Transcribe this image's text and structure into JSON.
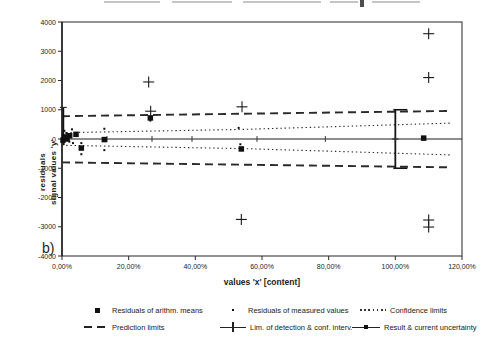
{
  "panel_label": "b)",
  "chart_data": {
    "type": "scatter",
    "title": "",
    "xlabel": "values 'x' [content]",
    "ylabel_line1": "residuals",
    "ylabel_line2": "signal values 'y'",
    "xlim": [
      0,
      120
    ],
    "ylim": [
      -4000,
      4000
    ],
    "grid": false,
    "x_tick_values": [
      0,
      20,
      40,
      60,
      80,
      100,
      120
    ],
    "x_tick_labels": [
      "0,00%",
      "20,00%",
      "40,00%",
      "60,00%",
      "80,00%",
      "100,00%",
      "120,00%"
    ],
    "y_tick_values": [
      4000,
      3000,
      2000,
      1000,
      0,
      -1000,
      -2000,
      -3000,
      -4000
    ],
    "y_tick_labels": [
      "4000",
      "3000",
      "2000",
      "1000",
      "0",
      "-1000",
      "-2000",
      "-3000",
      "-4000"
    ],
    "series": {
      "arith_means": {
        "label": "Residuals of arithm. means",
        "marker": "filled-square",
        "points": [
          [
            0.3,
            -40
          ],
          [
            0.8,
            70
          ],
          [
            1.5,
            0
          ],
          [
            2.3,
            110
          ],
          [
            4.2,
            160
          ],
          [
            5.8,
            -310
          ],
          [
            12.7,
            -20
          ],
          [
            26.5,
            720
          ],
          [
            53.8,
            -340
          ],
          [
            108.5,
            30
          ]
        ]
      },
      "measured_values": {
        "label": "Residuals of measured values",
        "marker": "dot",
        "points": [
          [
            0.5,
            -170
          ],
          [
            0.7,
            280
          ],
          [
            1.3,
            200
          ],
          [
            2.2,
            -90
          ],
          [
            3.0,
            330
          ],
          [
            3.3,
            -140
          ],
          [
            5.8,
            -140
          ],
          [
            5.8,
            -520
          ],
          [
            12.7,
            350
          ],
          [
            12.7,
            -380
          ],
          [
            26.5,
            630
          ],
          [
            53.0,
            380
          ],
          [
            53.5,
            -180
          ]
        ]
      },
      "outliers": {
        "label": "",
        "marker": "plus",
        "points": [
          [
            26.0,
            1950
          ],
          [
            26.6,
            950
          ],
          [
            54.0,
            1100
          ],
          [
            53.8,
            -2750
          ],
          [
            110,
            3600
          ],
          [
            110,
            2100
          ],
          [
            110,
            -2770
          ],
          [
            110,
            -3010
          ]
        ]
      },
      "confidence_limits": {
        "label": "Confidence limits",
        "style": "dotted",
        "upper": [
          [
            0,
            215
          ],
          [
            55,
            330
          ],
          [
            117,
            545
          ]
        ],
        "lower": [
          [
            0,
            -215
          ],
          [
            55,
            -330
          ],
          [
            117,
            -545
          ]
        ]
      },
      "prediction_limits": {
        "label": "Prediction limits",
        "style": "dashed",
        "upper": [
          [
            0,
            780
          ],
          [
            117,
            960
          ]
        ],
        "lower": [
          [
            0,
            -800
          ],
          [
            117,
            -970
          ]
        ]
      },
      "detection_conf_interval": {
        "label": "Lim. of detection & conf. interv.",
        "line_y": 0,
        "x_from": 0,
        "x_to": 120,
        "cross_tick_xs": [
          13.5,
          27,
          39,
          58.5,
          79
        ],
        "bar_x": 0.4,
        "bar_y_from": 0,
        "bar_y_to": 1080
      },
      "result_uncertainty": {
        "label": "Result & current uncertainty",
        "x": 100,
        "y_from": -1000,
        "y_to": 1000,
        "center_y": 0
      }
    }
  },
  "legend": {
    "items": [
      {
        "symbol": "filled-square",
        "label": "Residuals of arithm. means"
      },
      {
        "symbol": "dot",
        "label": "Residuals of measured values"
      },
      {
        "symbol": "dotted-line",
        "label": "Confidence limits"
      },
      {
        "symbol": "dashed-line",
        "label": "Prediction limits"
      },
      {
        "symbol": "line-with-plus",
        "label": "Lim. of detection & conf. interv."
      },
      {
        "symbol": "line-with-marker",
        "label": "Result & current uncertainty"
      }
    ]
  },
  "colors": {
    "ink": "#1c1c1c",
    "line": "#2a2a2a",
    "border": "#4a4a4a",
    "remnant": "#c4c4c4",
    "background": "#ffffff"
  }
}
